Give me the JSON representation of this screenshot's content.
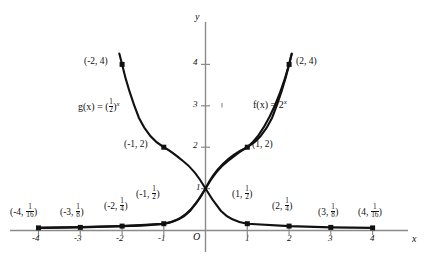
{
  "figure": {
    "axes": {
      "x_label": "x",
      "y_label": "y",
      "origin_label": "O",
      "x_ticks": [
        "-4",
        "-3",
        "-2",
        "-1",
        "1",
        "2",
        "3",
        "4"
      ],
      "y_ticks": [
        "1",
        "2",
        "3",
        "4"
      ]
    },
    "curve_labels": {
      "g": {
        "lhs": "g(x) = (",
        "base_num": "1",
        "base_den": "2",
        "rhs": ")",
        "exponent": "x"
      },
      "f": {
        "lhs": "f(x) = 2",
        "exponent": "x"
      }
    },
    "point_labels": {
      "f_minus2_4": "(-2, 4)",
      "f_2_4": "(2, 4)",
      "f_minus1_2": "(-1, 2)",
      "f_1_2": "(1, 2)"
    },
    "fraction_points": [
      {
        "name": "g-point-minus4",
        "open": "(-4, ",
        "num": "1",
        "den": "16",
        "close": ")"
      },
      {
        "name": "g-point-minus3",
        "open": "(-3, ",
        "num": "1",
        "den": "8",
        "close": ")"
      },
      {
        "name": "g-point-minus2",
        "open": "(-2, ",
        "num": "1",
        "den": "4",
        "close": ")"
      },
      {
        "name": "g-point-minus1",
        "open": "(-1, ",
        "num": "1",
        "den": "2",
        "close": ")"
      },
      {
        "name": "g-point-1",
        "open": "(1, ",
        "num": "1",
        "den": "2",
        "close": ")"
      },
      {
        "name": "g-point-2",
        "open": "(2, ",
        "num": "1",
        "den": "4",
        "close": ")"
      },
      {
        "name": "g-point-3",
        "open": "(3, ",
        "num": "1",
        "den": "8",
        "close": ")"
      },
      {
        "name": "g-point-4",
        "open": "(4, ",
        "num": "1",
        "den": "16",
        "close": ")"
      }
    ]
  },
  "chart_data": {
    "type": "line",
    "title": "",
    "xlabel": "x",
    "ylabel": "y",
    "xlim": [
      -4.35,
      4.35
    ],
    "ylim": [
      -0.12,
      4.6
    ],
    "grid": false,
    "legend": "inline-curve-labels",
    "series": [
      {
        "name": "f(x) = 2^x",
        "x": [
          -4,
          -3,
          -2,
          -1,
          0,
          1,
          2,
          3,
          4
        ],
        "y": [
          0.0625,
          0.125,
          0.25,
          0.5,
          1,
          2,
          4,
          8,
          16
        ],
        "drawn_domain": [
          -4,
          2.05
        ],
        "marked_points": [
          {
            "x": -4,
            "y": 0.0625,
            "label": "(-4, 1/16)"
          },
          {
            "x": -3,
            "y": 0.125,
            "label": "(-3, 1/8)"
          },
          {
            "x": -2,
            "y": 0.25,
            "label": "(-2, 1/4)"
          },
          {
            "x": -1,
            "y": 0.5,
            "label": "(-1, 1/2)"
          },
          {
            "x": 1,
            "y": 2,
            "label": "(1, 2)"
          },
          {
            "x": 2,
            "y": 4,
            "label": "(2, 4)"
          }
        ]
      },
      {
        "name": "g(x) = (1/2)^x",
        "x": [
          -4,
          -3,
          -2,
          -1,
          0,
          1,
          2,
          3,
          4
        ],
        "y": [
          16,
          8,
          4,
          2,
          1,
          0.5,
          0.25,
          0.125,
          0.0625
        ],
        "drawn_domain": [
          -2.05,
          4
        ],
        "marked_points": [
          {
            "x": -2,
            "y": 4,
            "label": "(-2, 4)"
          },
          {
            "x": -1,
            "y": 2,
            "label": "(-1, 2)"
          },
          {
            "x": 1,
            "y": 0.5,
            "label": "(1, 1/2)"
          },
          {
            "x": 2,
            "y": 0.25,
            "label": "(2, 1/4)"
          },
          {
            "x": 3,
            "y": 0.125,
            "label": "(3, 1/8)"
          },
          {
            "x": 4,
            "y": 0.0625,
            "label": "(4, 1/16)"
          }
        ]
      }
    ],
    "intersection": {
      "x": 0,
      "y": 1
    }
  },
  "colors": {
    "curve": "#111111",
    "axis": "#8a8a8a",
    "text": "#111111",
    "background": "#ffffff"
  }
}
